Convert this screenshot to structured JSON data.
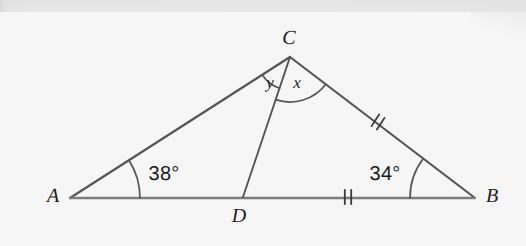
{
  "figure": {
    "kind": "geometry-diagram",
    "background_color": "#f4f4f4",
    "stroke_color": "#555555",
    "baseline_stroke_color": "#7d7d7d",
    "label_color": "#1c1c1c",
    "vertices": [
      {
        "name": "A",
        "label": "A",
        "x": 70,
        "y": 198,
        "label_x": 53,
        "label_y": 196
      },
      {
        "name": "B",
        "label": "B",
        "x": 475,
        "y": 198,
        "label_x": 492,
        "label_y": 196
      },
      {
        "name": "C",
        "label": "C",
        "x": 290,
        "y": 57,
        "label_x": 289,
        "label_y": 38
      },
      {
        "name": "D",
        "label": "D",
        "x": 243,
        "y": 197,
        "label_x": 239,
        "label_y": 216
      }
    ],
    "segments": [
      {
        "name": "side-AC",
        "from": "A",
        "to": "C",
        "width": 2.2
      },
      {
        "name": "side-CB",
        "from": "C",
        "to": "B",
        "width": 2.2
      },
      {
        "name": "side-AB",
        "from": "A",
        "to": "B",
        "width": 2.4
      },
      {
        "name": "segment-CD",
        "from": "C",
        "to": "D",
        "width": 1.9
      }
    ],
    "angles": [
      {
        "name": "angle-at-A",
        "vertex": "A",
        "label": "38°",
        "value": 38,
        "unit": "degrees",
        "arc_radius": 70,
        "label_x": 164,
        "label_y": 174
      },
      {
        "name": "angle-at-B",
        "vertex": "B",
        "label": "34°",
        "value": 34,
        "unit": "degrees",
        "arc_radius": 65,
        "label_x": 385,
        "label_y": 174
      },
      {
        "name": "angle-ACD",
        "vertex": "C",
        "label": "y",
        "value": null,
        "unit": "unknown-variable",
        "arc_radius": 33,
        "label_x": 270,
        "label_y": 83
      },
      {
        "name": "angle-DCB",
        "vertex": "C",
        "label": "x",
        "value": null,
        "unit": "unknown-variable",
        "arc_radius": 45,
        "label_x": 297,
        "label_y": 83
      }
    ],
    "congruence_marks": [
      {
        "name": "tick-mark-on-CB",
        "on_segment": "side-CB",
        "ticks": 2,
        "x": 378,
        "y": 122,
        "angle_deg": 33
      },
      {
        "name": "tick-mark-on-DB",
        "on_segment": "side-AB",
        "ticks": 2,
        "x": 348,
        "y": 197,
        "angle_deg": 0
      }
    ]
  }
}
